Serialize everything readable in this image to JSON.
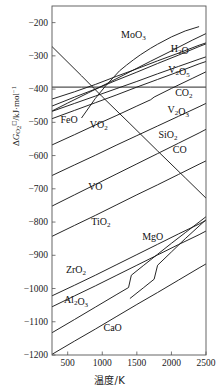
{
  "chart_data": {
    "type": "line",
    "title": "",
    "subtitle": "",
    "xlabel": "温度/K",
    "ylabel": "ΔG°(O2)/kJ·mol⁻¹",
    "ylabel_parts": {
      "delta_g": "ΔG",
      "sub": "O",
      "sub2": "2",
      "standard": "⊖",
      "units": "/kJ·mol"
    },
    "xlim": [
      273,
      2500
    ],
    "ylim": [
      -1200,
      -150
    ],
    "xticks": [
      500,
      1000,
      1500,
      2000,
      2500
    ],
    "yticks": [
      -200,
      -300,
      -400,
      -500,
      -600,
      -700,
      -800,
      -900,
      -1000,
      -1100,
      -1200
    ],
    "grid": false,
    "legend_position": "inline-labels",
    "axis_color": "#555555",
    "line_color": "#1a1a1a",
    "background": "#ffffff",
    "series": [
      {
        "name": "MoO3",
        "label": "MoO<sub>3</sub>",
        "label_x": 1450,
        "label_y": -247,
        "points": [
          [
            700,
            -487
          ],
          [
            900,
            -428
          ],
          [
            1050,
            -390
          ],
          [
            1250,
            -345
          ],
          [
            1350,
            -328
          ],
          [
            1450,
            -312
          ],
          [
            1550,
            -297
          ],
          [
            1700,
            -277
          ],
          [
            1800,
            -265
          ],
          [
            2000,
            -243
          ],
          [
            2200,
            -225
          ],
          [
            2400,
            -212
          ]
        ]
      },
      {
        "name": "H2O",
        "label": "H<sub>2</sub>O",
        "label_x": 2120,
        "label_y": -288,
        "points": [
          [
            273,
            -466
          ],
          [
            500,
            -442
          ],
          [
            800,
            -411
          ],
          [
            1100,
            -380
          ],
          [
            1400,
            -348
          ],
          [
            1700,
            -316
          ],
          [
            2000,
            -285
          ],
          [
            2300,
            -253
          ],
          [
            2500,
            -233
          ]
        ]
      },
      {
        "name": "V2O5",
        "label": "V<sub>2</sub>O<sub>5</sub>",
        "label_x": 2110,
        "label_y": -352,
        "points": [
          [
            273,
            -430
          ],
          [
            600,
            -408
          ],
          [
            900,
            -386
          ],
          [
            1200,
            -362
          ],
          [
            1500,
            -339
          ],
          [
            1800,
            -315
          ],
          [
            2100,
            -292
          ],
          [
            2400,
            -268
          ],
          [
            2500,
            -261
          ]
        ]
      },
      {
        "name": "CO2",
        "label": "CO<sub>2</sub>",
        "label_x": 2180,
        "label_y": -420,
        "points": [
          [
            273,
            -394
          ],
          [
            700,
            -394
          ],
          [
            1200,
            -394
          ],
          [
            1700,
            -394
          ],
          [
            2100,
            -394
          ],
          [
            2500,
            -394
          ]
        ]
      },
      {
        "name": "C-to-CO2-descending",
        "label": "",
        "label_x": 0,
        "label_y": 0,
        "points": [
          [
            273,
            -272
          ],
          [
            700,
            -360
          ],
          [
            1000,
            -423
          ],
          [
            1400,
            -504
          ],
          [
            1800,
            -586
          ],
          [
            2200,
            -667
          ],
          [
            2500,
            -728
          ]
        ]
      },
      {
        "name": "FeO",
        "label": "FeO",
        "label_x": 520,
        "label_y": -502,
        "points": [
          [
            273,
            -451
          ],
          [
            600,
            -424
          ],
          [
            900,
            -400
          ],
          [
            1200,
            -374
          ],
          [
            1500,
            -349
          ],
          [
            1800,
            -323
          ],
          [
            2100,
            -298
          ],
          [
            2400,
            -272
          ],
          [
            2500,
            -264
          ]
        ]
      },
      {
        "name": "V2O3",
        "label": "V<sub>2</sub>O<sub>3</sub>",
        "label_x": 2100,
        "label_y": -473,
        "points": [
          [
            273,
            -467
          ],
          [
            600,
            -443
          ],
          [
            900,
            -421
          ],
          [
            1200,
            -399
          ],
          [
            1500,
            -377
          ],
          [
            1800,
            -354
          ],
          [
            2100,
            -332
          ],
          [
            2400,
            -310
          ],
          [
            2500,
            -303
          ]
        ]
      },
      {
        "name": "VO2",
        "label": "VO<sub>2</sub>",
        "label_x": 950,
        "label_y": -518,
        "points": [
          [
            273,
            -489
          ],
          [
            600,
            -464
          ],
          [
            900,
            -441
          ],
          [
            1200,
            -418
          ],
          [
            1500,
            -394
          ],
          [
            1800,
            -371
          ],
          [
            2100,
            -348
          ],
          [
            2400,
            -324
          ],
          [
            2500,
            -317
          ]
        ]
      },
      {
        "name": "SiO2",
        "label": "SiO<sub>2</sub>",
        "label_x": 1950,
        "label_y": -548,
        "points": [
          [
            273,
            -568
          ],
          [
            600,
            -537
          ],
          [
            900,
            -508
          ],
          [
            1200,
            -480
          ],
          [
            1500,
            -451
          ],
          [
            1700,
            -432
          ],
          [
            1750,
            -424
          ],
          [
            2000,
            -398
          ],
          [
            2300,
            -368
          ],
          [
            2500,
            -348
          ]
        ]
      },
      {
        "name": "CO",
        "label": "CO",
        "label_x": 2120,
        "label_y": -593,
        "points": [
          [
            273,
            -660
          ],
          [
            600,
            -628
          ],
          [
            900,
            -599
          ],
          [
            1200,
            -569
          ],
          [
            1500,
            -540
          ],
          [
            1800,
            -511
          ],
          [
            2100,
            -482
          ],
          [
            2400,
            -453
          ],
          [
            2500,
            -443
          ]
        ]
      },
      {
        "name": "VO",
        "label": "VO",
        "label_x": 900,
        "label_y": -704,
        "points": [
          [
            273,
            -752
          ],
          [
            600,
            -718
          ],
          [
            900,
            -687
          ],
          [
            1200,
            -656
          ],
          [
            1500,
            -625
          ],
          [
            1800,
            -594
          ],
          [
            2100,
            -563
          ],
          [
            2400,
            -532
          ],
          [
            2500,
            -521
          ]
        ]
      },
      {
        "name": "TiO2",
        "label": "TiO<sub>2</sub>",
        "label_x": 980,
        "label_y": -808,
        "points": [
          [
            273,
            -843
          ],
          [
            600,
            -810
          ],
          [
            900,
            -780
          ],
          [
            1200,
            -749
          ],
          [
            1500,
            -718
          ],
          [
            1800,
            -688
          ],
          [
            2100,
            -657
          ],
          [
            2400,
            -626
          ],
          [
            2500,
            -616
          ]
        ]
      },
      {
        "name": "ZrO2",
        "label": "ZrO<sub>2</sub>",
        "label_x": 620,
        "label_y": -952,
        "points": [
          [
            273,
            -1022
          ],
          [
            600,
            -990
          ],
          [
            900,
            -960
          ],
          [
            1200,
            -929
          ],
          [
            1500,
            -898
          ],
          [
            1800,
            -867
          ],
          [
            2100,
            -836
          ],
          [
            2400,
            -806
          ],
          [
            2500,
            -795
          ]
        ]
      },
      {
        "name": "Al2O3",
        "label": "Al<sub>2</sub>O<sub>3</sub>",
        "label_x": 620,
        "label_y": -1043,
        "points": [
          [
            273,
            -1055
          ],
          [
            600,
            -1022
          ],
          [
            900,
            -992
          ],
          [
            1200,
            -961
          ],
          [
            1500,
            -930
          ],
          [
            1800,
            -899
          ],
          [
            2100,
            -868
          ],
          [
            2400,
            -838
          ],
          [
            2500,
            -827
          ]
        ]
      },
      {
        "name": "MgO",
        "label": "MgO",
        "label_x": 1730,
        "label_y": -855,
        "points": [
          [
            273,
            -1133
          ],
          [
            600,
            -1093
          ],
          [
            900,
            -1056
          ],
          [
            1200,
            -1019
          ],
          [
            1380,
            -997
          ],
          [
            1420,
            -960
          ],
          [
            1600,
            -930
          ],
          [
            1800,
            -897
          ],
          [
            2000,
            -864
          ],
          [
            2200,
            -832
          ],
          [
            2400,
            -800
          ],
          [
            2500,
            -784
          ]
        ]
      },
      {
        "name": "MgO-secondary",
        "label": "",
        "label_x": 0,
        "label_y": 0,
        "points": [
          [
            1400,
            -1030
          ],
          [
            1600,
            -997
          ],
          [
            1750,
            -972
          ],
          [
            1800,
            -930
          ],
          [
            2000,
            -890
          ],
          [
            2200,
            -850
          ],
          [
            2400,
            -812
          ],
          [
            2500,
            -793
          ]
        ]
      },
      {
        "name": "CaO",
        "label": "CaO",
        "label_x": 1150,
        "label_y": -1128,
        "points": [
          [
            273,
            -1198
          ],
          [
            600,
            -1158
          ],
          [
            900,
            -1122
          ],
          [
            1200,
            -1085
          ],
          [
            1500,
            -1048
          ],
          [
            1800,
            -1012
          ],
          [
            2100,
            -975
          ],
          [
            2400,
            -938
          ],
          [
            2500,
            -926
          ]
        ]
      }
    ]
  },
  "axes": {
    "x_tick_labels": [
      "500",
      "1000",
      "1500",
      "2000",
      "2500"
    ],
    "y_tick_labels": [
      "-200",
      "-300",
      "-400",
      "-500",
      "-600",
      "-700",
      "-800",
      "-900",
      "-1000",
      "-1100",
      "-1200"
    ]
  }
}
